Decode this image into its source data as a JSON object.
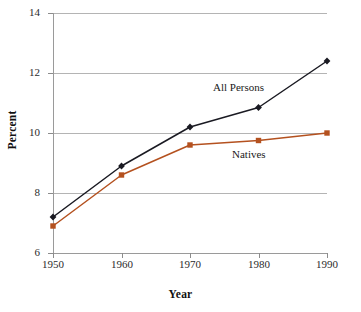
{
  "chart_data": {
    "type": "line",
    "title": "",
    "xlabel": "Year",
    "ylabel": "Percent",
    "x": [
      1950,
      1960,
      1970,
      1980,
      1990
    ],
    "categories": [
      "1950",
      "1960",
      "1970",
      "1980",
      "1990"
    ],
    "xlim": [
      1950,
      1990
    ],
    "ylim": [
      6,
      14
    ],
    "yticks": [
      6,
      8,
      10,
      12,
      14
    ],
    "ytick_labels": [
      "6",
      "8",
      "10",
      "12",
      "14"
    ],
    "xticks": [
      1950,
      1960,
      1970,
      1980,
      1990
    ],
    "xtick_labels": [
      "1950",
      "1960",
      "1970",
      "1980",
      "1990"
    ],
    "grid": "horizontal",
    "legend": "inline-annotations",
    "series": [
      {
        "name": "All Persons",
        "color": "#1a1a22",
        "marker": "diamond",
        "values": [
          7.2,
          8.9,
          10.2,
          10.85,
          12.4
        ],
        "label_position": "above-right-of-1970-1980-segment"
      },
      {
        "name": "Natives",
        "color": "#b4511f",
        "marker": "square",
        "values": [
          6.9,
          8.6,
          9.6,
          9.75,
          10.0
        ],
        "label_position": "below-1980-point"
      }
    ],
    "annotations": [
      {
        "text": "All Persons",
        "series": "All Persons"
      },
      {
        "text": "Natives",
        "series": "Natives"
      }
    ]
  },
  "axis": {
    "y_title": "Percent",
    "x_title": "Year"
  },
  "colors": {
    "all_persons": "#1a1a22",
    "natives": "#b4511f",
    "gridline": "#b4b4b4",
    "axis": "#9a9a9a",
    "background": "#ffffff"
  }
}
